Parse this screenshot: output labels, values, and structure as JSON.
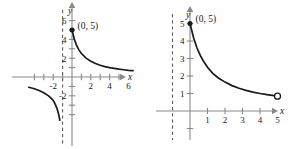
{
  "figure": {
    "background": "#ffffff",
    "curve_color": "#1a1a1a",
    "axis_color": "#8a8a8a",
    "asymptote_color": "#5c5c5c"
  },
  "chart_data": [
    {
      "type": "line",
      "title": "",
      "name": "left-graph-full-hyperbola",
      "xlabel": "x",
      "ylabel": "y",
      "xlim": [
        -5,
        7.4
      ],
      "ylim": [
        -4.6,
        7.4
      ],
      "grid": false,
      "legend": null,
      "xticks": [
        -4,
        -3,
        -2,
        -1,
        1,
        2,
        3,
        4,
        5,
        6
      ],
      "xtick_labels": [
        "-2",
        "2",
        "4",
        "6"
      ],
      "xtick_label_values": [
        -2,
        2,
        4,
        6
      ],
      "yticks": [
        -4,
        -3,
        -2,
        -1,
        1,
        2,
        3,
        4,
        5,
        6
      ],
      "ytick_labels": [
        "6",
        "4",
        "2",
        "-2"
      ],
      "ytick_label_values": [
        6,
        4,
        2,
        -2
      ],
      "asymptotes": [
        {
          "type": "vertical",
          "x": -1,
          "style": "dashed"
        }
      ],
      "annotations": [
        {
          "text": "(0, 5)",
          "x": 0,
          "y": 5,
          "marker": "filled-dot"
        }
      ],
      "series": [
        {
          "name": "upper-right-branch",
          "points": [
            [
              0,
              5
            ],
            [
              0.25,
              4.0
            ],
            [
              0.5,
              3.33
            ],
            [
              0.75,
              2.86
            ],
            [
              1,
              2.5
            ],
            [
              1.5,
              2.0
            ],
            [
              2,
              1.67
            ],
            [
              2.5,
              1.43
            ],
            [
              3,
              1.25
            ],
            [
              3.5,
              1.11
            ],
            [
              4,
              1.0
            ],
            [
              4.5,
              0.91
            ],
            [
              5,
              0.83
            ],
            [
              5.5,
              0.77
            ],
            [
              6,
              0.71
            ],
            [
              6.5,
              0.67
            ]
          ]
        },
        {
          "name": "lower-left-branch",
          "points": [
            [
              -4.6,
              -1.09
            ],
            [
              -4,
              -1.25
            ],
            [
              -3.5,
              -1.43
            ],
            [
              -3,
              -1.67
            ],
            [
              -2.5,
              -2.0
            ],
            [
              -2.2,
              -2.27
            ],
            [
              -2,
              -2.5
            ],
            [
              -1.8,
              -2.86
            ],
            [
              -1.6,
              -3.33
            ],
            [
              -1.45,
              -3.85
            ],
            [
              -1.35,
              -4.3
            ],
            [
              -1.3,
              -4.6
            ]
          ]
        }
      ]
    },
    {
      "type": "line",
      "title": "",
      "name": "right-graph-restricted-branch",
      "xlabel": "x",
      "ylabel": "y",
      "xlim": [
        -2.2,
        6.4
      ],
      "ylim": [
        -1.8,
        6.6
      ],
      "grid": false,
      "legend": null,
      "xticks": [
        1,
        2,
        3,
        4,
        5
      ],
      "xtick_labels": [
        "1",
        "2",
        "3",
        "4",
        "5"
      ],
      "xtick_label_values": [
        1,
        2,
        3,
        4,
        5
      ],
      "yticks": [
        -1,
        1,
        2,
        3,
        4,
        5
      ],
      "ytick_labels": [
        "1",
        "2",
        "3",
        "4",
        "5"
      ],
      "ytick_label_values": [
        1,
        2,
        3,
        4,
        5
      ],
      "asymptotes": [
        {
          "type": "vertical",
          "x": -1,
          "style": "dashed"
        }
      ],
      "annotations": [
        {
          "text": "(0, 5)",
          "x": 0,
          "y": 5,
          "marker": "filled-dot"
        },
        {
          "text": "",
          "x": 5,
          "y": 0.85,
          "marker": "open-circle"
        }
      ],
      "series": [
        {
          "name": "restricted-branch",
          "points": [
            [
              0,
              5
            ],
            [
              0.2,
              4.2
            ],
            [
              0.4,
              3.6
            ],
            [
              0.6,
              3.15
            ],
            [
              0.8,
              2.8
            ],
            [
              1,
              2.5
            ],
            [
              1.3,
              2.15
            ],
            [
              1.6,
              1.9
            ],
            [
              2,
              1.65
            ],
            [
              2.4,
              1.45
            ],
            [
              2.8,
              1.3
            ],
            [
              3.2,
              1.18
            ],
            [
              3.6,
              1.08
            ],
            [
              4,
              1.0
            ],
            [
              4.4,
              0.94
            ],
            [
              5,
              0.85
            ]
          ]
        }
      ]
    }
  ]
}
